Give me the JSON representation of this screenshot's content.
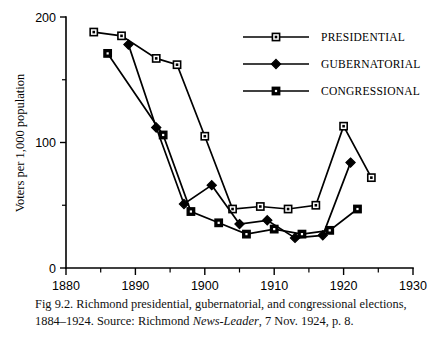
{
  "figure": {
    "caption_prefix": "Fig 9.2. Richmond presidential, gubernatorial, and congressional elections, 1884–1924. Source: Richmond ",
    "caption_italic": "News-Leader",
    "caption_suffix": ", 7 Nov. 1924, p. 8."
  },
  "chart_data": {
    "type": "line",
    "title": "",
    "xlabel": "",
    "ylabel": "Voters per 1,000 population",
    "xlim": [
      1880,
      1930
    ],
    "ylim": [
      0,
      200
    ],
    "x_ticks": [
      1880,
      1890,
      1900,
      1910,
      1920,
      1930
    ],
    "x_tick_labels": [
      "1880",
      "1890",
      "1900",
      "1910",
      "1920",
      "1930"
    ],
    "x_minor_ticks": [
      1885,
      1895,
      1905,
      1915,
      1925
    ],
    "y_ticks": [
      0,
      100,
      200
    ],
    "y_tick_labels": [
      "0",
      "100",
      "200"
    ],
    "y_minor_ticks": [
      50,
      150
    ],
    "grid": false,
    "legend_position": "upper right",
    "series": [
      {
        "name": "PRESIDENTIAL",
        "marker": "open-square",
        "x": [
          1884,
          1888,
          1893,
          1896,
          1900,
          1904,
          1908,
          1912,
          1916,
          1920,
          1924
        ],
        "values": [
          188,
          185,
          167,
          162,
          105,
          47,
          49,
          47,
          50,
          113,
          72
        ]
      },
      {
        "name": "GUBERNATORIAL",
        "marker": "filled-diamond",
        "x": [
          1889,
          1893,
          1897,
          1901,
          1905,
          1909,
          1913,
          1917,
          1921
        ],
        "values": [
          178,
          112,
          51,
          66,
          35,
          38,
          24,
          26,
          84
        ]
      },
      {
        "name": "CONGRESSIONAL",
        "marker": "filled-square",
        "x": [
          1886,
          1894,
          1898,
          1902,
          1906,
          1910,
          1914,
          1918,
          1922
        ],
        "values": [
          171,
          106,
          45,
          36,
          27,
          31,
          27,
          30,
          47
        ]
      }
    ]
  },
  "legend": {
    "items": [
      {
        "label": "PRESIDENTIAL",
        "marker": "open-square"
      },
      {
        "label": "GUBERNATORIAL",
        "marker": "filled-diamond"
      },
      {
        "label": "CONGRESSIONAL",
        "marker": "filled-square"
      }
    ]
  }
}
